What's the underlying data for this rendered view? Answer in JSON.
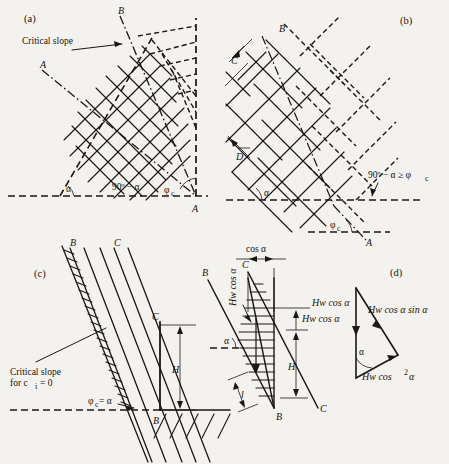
{
  "figure": {
    "background_color": "#f4f2ee",
    "ink_color": "#1a1714"
  },
  "panels": [
    {
      "id": "panel-a",
      "tag": "(a)",
      "labels": {
        "critical_slope": "Critical slope",
        "point_b": "B",
        "point_a_left": "A",
        "point_a_right": "A",
        "alpha": "α",
        "ninety_minus_alpha": "90º − α",
        "phi_c": "φ",
        "phi_c_sub": "c"
      }
    },
    {
      "id": "panel-b",
      "tag": "(b)",
      "labels": {
        "point_b": "B",
        "spacing_c": "C",
        "spacing_d": "D",
        "alpha": "α",
        "inequality": "90º − α ≥ φ",
        "inequality_sub": "c",
        "phi_c": "φ",
        "phi_c_sub": "c",
        "point_a": "A"
      }
    },
    {
      "id": "panel-c",
      "tag": "(c)",
      "labels": {
        "point_b_top": "B",
        "point_c_top": "C",
        "point_c_right": "C",
        "point_b_bottom": "B",
        "critical_slope_line1": "Critical slope",
        "critical_slope_line2": "for c",
        "critical_slope_sub": "i",
        "critical_slope_line3": "= 0",
        "phi_eq_alpha": "φ",
        "phi_eq_alpha_sub": "c",
        "phi_eq_alpha_rest": "= α",
        "height": "H"
      }
    },
    {
      "id": "panel-mid",
      "tag": "",
      "labels": {
        "cos_alpha": "cos α",
        "point_b_top": "B",
        "point_c_top": "C",
        "point_c_bottom": "C",
        "point_b_bottom": "B",
        "hw_cos_alpha_vertical": "Hw cos α",
        "hw_cos_alpha_right": "Hw cos α",
        "alpha": "α",
        "height": "H",
        "thickness": "l"
      }
    },
    {
      "id": "panel-d",
      "tag": "(d)",
      "labels": {
        "vector_left": "Hw cos α",
        "vector_hyp": "Hw cos α sin α",
        "vector_base_pre": "Hw cos",
        "vector_base_sup": "2",
        "vector_base_post": "α",
        "alpha": "α"
      }
    }
  ]
}
